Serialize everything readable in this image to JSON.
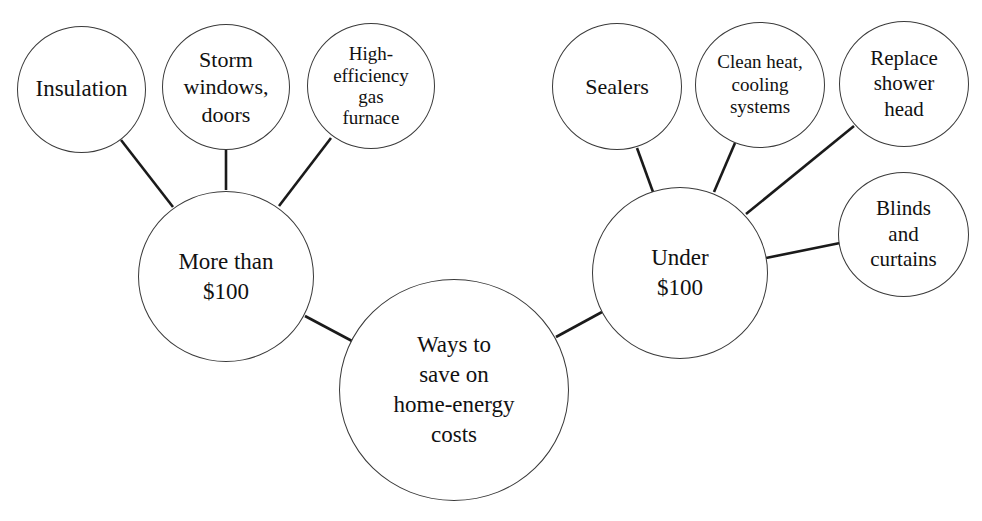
{
  "diagram": {
    "type": "bubble-tree",
    "root": {
      "label": "Ways to\nsave on\nhome-energy\ncosts"
    },
    "branches": [
      {
        "label": "More than\n$100",
        "children": [
          {
            "label": "Insulation"
          },
          {
            "label": "Storm\nwindows,\ndoors"
          },
          {
            "label": "High-\nefficiency\ngas\nfurnace"
          }
        ]
      },
      {
        "label": "Under\n$100",
        "children": [
          {
            "label": "Sealers"
          },
          {
            "label": "Clean heat,\ncooling\nsystems"
          },
          {
            "label": "Replace\nshower\nhead"
          },
          {
            "label": "Blinds\nand\ncurtains"
          }
        ]
      }
    ],
    "colors": {
      "background": "#ffffff",
      "stroke": "#3a3a3a",
      "text": "#111111",
      "connector": "#1a1a1a"
    }
  }
}
